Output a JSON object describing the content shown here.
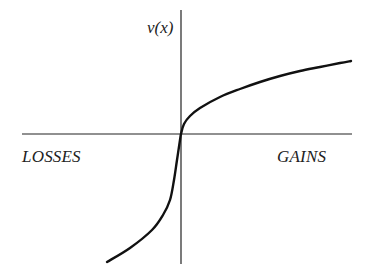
{
  "chart_data": {
    "type": "line",
    "title": "",
    "xlabel": "",
    "ylabel": "v(x)",
    "annotations": [
      {
        "text": "LOSSES",
        "position": "left, below x-axis"
      },
      {
        "text": "GAINS",
        "position": "right, below x-axis"
      }
    ],
    "grid": false,
    "legend": null,
    "axes": {
      "origin_px": [
        181,
        134
      ],
      "x_axis_px": {
        "from": [
          22,
          134
        ],
        "to": [
          352,
          134
        ]
      },
      "y_axis_px": {
        "from": [
          181,
          10
        ],
        "to": [
          181,
          264
        ]
      },
      "ticks": "none"
    },
    "series": [
      {
        "name": "value function v(x)",
        "description": "S-shaped prospect-theory value function: concave for gains, convex and steeper for losses",
        "points_px": [
          [
            107,
            262
          ],
          [
            130,
            248
          ],
          [
            152,
            230
          ],
          [
            163,
            215
          ],
          [
            170,
            200
          ],
          [
            174,
            180
          ],
          [
            177,
            160
          ],
          [
            180,
            140
          ],
          [
            181,
            134
          ],
          [
            184,
            124
          ],
          [
            190,
            116
          ],
          [
            200,
            108
          ],
          [
            220,
            97
          ],
          [
            240,
            89
          ],
          [
            260,
            82
          ],
          [
            280,
            76
          ],
          [
            300,
            71
          ],
          [
            320,
            67
          ],
          [
            340,
            63
          ],
          [
            351,
            61
          ]
        ]
      }
    ],
    "colors": {
      "curve": "#111111",
      "axes": "#222222",
      "text": "#222222",
      "background": "#ffffff"
    }
  },
  "labels": {
    "y_axis": "v(x)",
    "losses": "LOSSES",
    "gains": "GAINS"
  }
}
